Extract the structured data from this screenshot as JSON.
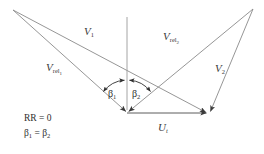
{
  "figure": {
    "background_color": "#ffffff",
    "line_color": "#808080",
    "arrow_color": "#3a3a3a",
    "text_color": "#2e2e2e",
    "width": 264,
    "height": 154
  },
  "vectors": [
    {
      "id": "v1",
      "label_main": "V",
      "label_sub": "1",
      "from": [
        13,
        10
      ],
      "to": [
        209,
        114
      ],
      "label_pos": [
        84,
        28
      ]
    },
    {
      "id": "vrel1",
      "label_main": "V",
      "label_sub": "rel",
      "label_subsub": "1",
      "from": [
        13,
        10
      ],
      "to": [
        127,
        114
      ],
      "label_pos": [
        46,
        63
      ]
    },
    {
      "id": "vrel2",
      "label_main": "V",
      "label_sub": "rel",
      "label_subsub": "2",
      "from": [
        253,
        9
      ],
      "to": [
        127,
        114
      ],
      "label_pos": [
        163,
        32
      ]
    },
    {
      "id": "v2",
      "label_main": "V",
      "label_sub": "2",
      "from": [
        253,
        9
      ],
      "to": [
        209,
        114
      ],
      "label_pos": [
        215,
        64
      ]
    },
    {
      "id": "ut",
      "label_main": "U",
      "label_sub": "t",
      "from": [
        127,
        113
      ],
      "to": [
        209,
        113
      ],
      "label_pos": [
        158,
        120
      ]
    }
  ],
  "axis": {
    "name": "vertical-reference-line",
    "from": [
      127,
      17
    ],
    "to": [
      127,
      114
    ]
  },
  "angles": [
    {
      "id": "beta1",
      "label_main": "β",
      "label_sub": "1",
      "label_pos": [
        108,
        85
      ]
    },
    {
      "id": "beta2",
      "label_main": "β",
      "label_sub": "2",
      "label_pos": [
        132,
        85
      ]
    }
  ],
  "notes": [
    {
      "id": "rr-condition",
      "text": "RR = 0",
      "pos": [
        24,
        114
      ]
    },
    {
      "id": "beta-equality",
      "prefix": "β",
      "sub1": "1",
      "middle": " = β",
      "sub2": "2",
      "pos": [
        24,
        129
      ]
    }
  ]
}
